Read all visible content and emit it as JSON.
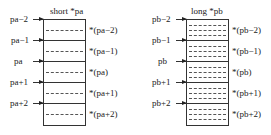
{
  "left": {
    "title": "short *pa",
    "pointers": [
      "pa−2",
      "pa−1",
      "pa",
      "pa+1",
      "pa+2"
    ],
    "values": [
      "*(pa−2)",
      "*(pa−1)",
      "*(pa)",
      "*(pa+1)",
      "*(pa+2)"
    ]
  },
  "right": {
    "title": "long *pb",
    "pointers": [
      "pb−2",
      "pb−1",
      "pb",
      "pb+1",
      "pb+2"
    ],
    "values": [
      "*(pb−2)",
      "*(pb−1)",
      "*(pb)",
      "*(pb+1)",
      "*(pb+2)"
    ]
  }
}
